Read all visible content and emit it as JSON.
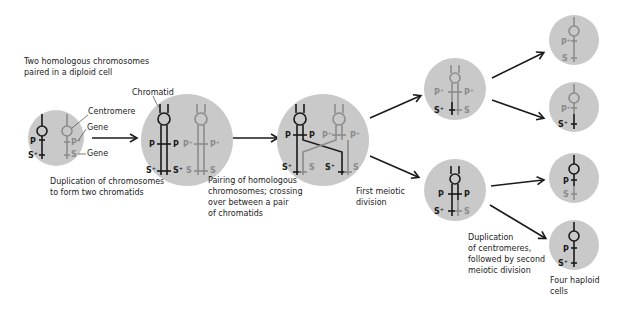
{
  "colors": {
    "cell_fill": "#c9c9c9",
    "dark_chromosome": "#1a1a1a",
    "grey_chromosome": "#8c8c8c",
    "background": "#ffffff"
  },
  "captions": {
    "stage0_line1": "Two homologous chromosomes",
    "stage0_line2": "paired in a diploid cell",
    "stage1_line1": "Duplication of chromosomes",
    "stage1_line2": "to form two chromatids",
    "stage2_line1": "Pairing of homologous",
    "stage2_line2": "chromosomes; crossing",
    "stage2_line3": "over between a pair",
    "stage2_line4": "of chromatids",
    "stage3_line1": "First meiotic",
    "stage3_line2": "division",
    "stage4_line1": "Duplication",
    "stage4_line2": "of centromeres,",
    "stage4_line3": "followed by second",
    "stage4_line4": "meiotic division",
    "stage5_line1": "Four haploid",
    "stage5_line2": "cells"
  },
  "annotations": {
    "centromere": "Centromere",
    "gene1": "Gene",
    "gene2": "Gene",
    "chromatid": "Chromatid"
  },
  "genes": {
    "P": "P",
    "P_plus": "P⁺",
    "S": "S",
    "S_plus": "S⁺"
  },
  "cells": [
    {
      "id": "diploid",
      "left": [
        "P",
        "S⁺"
      ],
      "right": [
        "P⁺",
        "S"
      ]
    },
    {
      "id": "duplicated",
      "left": [
        "P",
        "P",
        "S⁺",
        "S⁺"
      ],
      "right": [
        "P⁺",
        "P⁺",
        "S",
        "S"
      ]
    },
    {
      "id": "crossover",
      "left": [
        "P",
        "P",
        "S⁺",
        "S"
      ],
      "right": [
        "P⁺",
        "P⁺",
        "S⁺",
        "S"
      ]
    },
    {
      "id": "division1-top",
      "genes": [
        "P⁺",
        "P⁺",
        "S⁺",
        "S"
      ]
    },
    {
      "id": "division1-bottom",
      "genes": [
        "P",
        "P",
        "S⁺",
        "S"
      ]
    },
    {
      "id": "haploid-1",
      "genes": [
        "P⁺",
        "S"
      ]
    },
    {
      "id": "haploid-2",
      "genes": [
        "P⁺",
        "S⁺"
      ]
    },
    {
      "id": "haploid-3",
      "genes": [
        "P",
        "S"
      ]
    },
    {
      "id": "haploid-4",
      "genes": [
        "P",
        "S⁺"
      ]
    }
  ]
}
